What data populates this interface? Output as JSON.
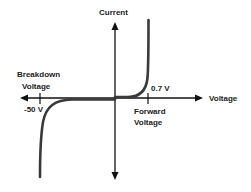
{
  "diagram": {
    "y_axis_label": "Current",
    "x_axis_label": "Voltage",
    "breakdown": {
      "label_line1": "Breakdown",
      "label_line2": "Voltage",
      "value": "-50 V"
    },
    "forward": {
      "label_line1": "Forward",
      "label_line2": "Voltage",
      "value": "0.7 V"
    },
    "colors": {
      "axis": "#111111",
      "curve": "#3a3a3a",
      "text": "#222222",
      "background": "#ffffff"
    }
  }
}
